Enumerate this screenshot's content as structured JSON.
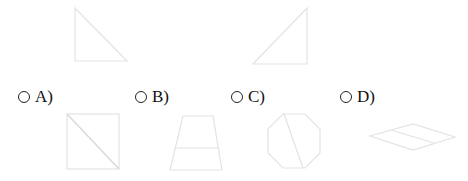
{
  "question": {
    "figures": [
      {
        "name": "right-triangle-left",
        "shape": "triangle",
        "points": "75,8 75,61 127,61"
      },
      {
        "name": "right-triangle-right",
        "shape": "triangle",
        "points": "253,64 307,8 307,64"
      }
    ]
  },
  "options": [
    {
      "letter": "A)",
      "shape": "square-with-diagonal"
    },
    {
      "letter": "B)",
      "shape": "trapezoid-with-midline"
    },
    {
      "letter": "C)",
      "shape": "octagon-with-chord"
    },
    {
      "letter": "D)",
      "shape": "rhombus-with-midline"
    }
  ],
  "colors": {
    "stroke": "#e6e6e6",
    "text": "#111111"
  }
}
